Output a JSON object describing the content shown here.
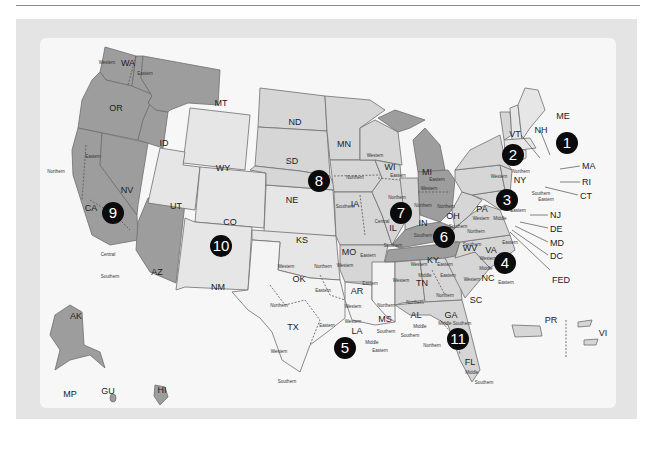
{
  "map": {
    "title": "U.S. Federal Judicial Circuits and Districts",
    "colors": {
      "frame": "#e4e4e4",
      "panel": "#f7f7f7",
      "shade_dark": "#9d9d9d",
      "shade_mid": "#b9b9b9",
      "shade_light": "#d6d6d6",
      "shade_pale": "#e6e6e6",
      "shade_white": "#f4f4f4",
      "badge": "#0b0b0b"
    },
    "states": [
      {
        "abbr": "WA",
        "districts": [
          "Western",
          "Eastern"
        ]
      },
      {
        "abbr": "OR",
        "districts": []
      },
      {
        "abbr": "ID",
        "districts": []
      },
      {
        "abbr": "MT",
        "districts": []
      },
      {
        "abbr": "CA",
        "districts": [
          "Northern",
          "Eastern",
          "Central",
          "Southern"
        ]
      },
      {
        "abbr": "NV",
        "districts": []
      },
      {
        "abbr": "AZ",
        "districts": []
      },
      {
        "abbr": "AK",
        "districts": []
      },
      {
        "abbr": "HI",
        "districts": []
      },
      {
        "abbr": "GU",
        "districts": []
      },
      {
        "abbr": "MP",
        "districts": []
      },
      {
        "abbr": "WY",
        "districts": []
      },
      {
        "abbr": "UT",
        "districts": []
      },
      {
        "abbr": "CO",
        "districts": []
      },
      {
        "abbr": "NM",
        "districts": []
      },
      {
        "abbr": "KS",
        "districts": []
      },
      {
        "abbr": "OK",
        "districts": [
          "Western",
          "Northern",
          "Eastern"
        ]
      },
      {
        "abbr": "ND",
        "districts": []
      },
      {
        "abbr": "SD",
        "districts": []
      },
      {
        "abbr": "NE",
        "districts": []
      },
      {
        "abbr": "MN",
        "districts": []
      },
      {
        "abbr": "IA",
        "districts": [
          "Northern",
          "Southern"
        ]
      },
      {
        "abbr": "MO",
        "districts": [
          "Western",
          "Eastern"
        ]
      },
      {
        "abbr": "AR",
        "districts": [
          "Western",
          "Eastern"
        ]
      },
      {
        "abbr": "TX",
        "districts": [
          "Northern",
          "Eastern",
          "Western",
          "Southern"
        ]
      },
      {
        "abbr": "LA",
        "districts": [
          "Western",
          "Middle",
          "Eastern"
        ]
      },
      {
        "abbr": "MS",
        "districts": [
          "Northern",
          "Southern"
        ]
      },
      {
        "abbr": "WI",
        "districts": [
          "Western",
          "Eastern"
        ]
      },
      {
        "abbr": "IL",
        "districts": [
          "Northern",
          "Central",
          "Southern"
        ]
      },
      {
        "abbr": "IN",
        "districts": [
          "Northern",
          "Southern"
        ]
      },
      {
        "abbr": "MI",
        "districts": [
          "Western",
          "Eastern"
        ]
      },
      {
        "abbr": "OH",
        "districts": [
          "Northern",
          "Southern"
        ]
      },
      {
        "abbr": "KY",
        "districts": [
          "Western",
          "Eastern"
        ]
      },
      {
        "abbr": "TN",
        "districts": [
          "Western",
          "Middle",
          "Eastern"
        ]
      },
      {
        "abbr": "AL",
        "districts": [
          "Northern",
          "Middle",
          "Southern"
        ]
      },
      {
        "abbr": "GA",
        "districts": [
          "Northern",
          "Middle",
          "Southern"
        ]
      },
      {
        "abbr": "FL",
        "districts": [
          "Northern",
          "Middle",
          "Southern"
        ]
      },
      {
        "abbr": "SC",
        "districts": []
      },
      {
        "abbr": "NC",
        "districts": [
          "Western",
          "Middle",
          "Eastern"
        ]
      },
      {
        "abbr": "VA",
        "districts": [
          "Western",
          "Eastern"
        ]
      },
      {
        "abbr": "WV",
        "districts": [
          "Northern",
          "Southern"
        ]
      },
      {
        "abbr": "MD",
        "districts": []
      },
      {
        "abbr": "DE",
        "districts": []
      },
      {
        "abbr": "DC",
        "districts": []
      },
      {
        "abbr": "PA",
        "districts": [
          "Western",
          "Middle",
          "Eastern"
        ]
      },
      {
        "abbr": "NJ",
        "districts": []
      },
      {
        "abbr": "NY",
        "districts": [
          "Western",
          "Northern",
          "Southern",
          "Eastern"
        ]
      },
      {
        "abbr": "CT",
        "districts": []
      },
      {
        "abbr": "RI",
        "districts": []
      },
      {
        "abbr": "MA",
        "districts": []
      },
      {
        "abbr": "VT",
        "districts": []
      },
      {
        "abbr": "NH",
        "districts": []
      },
      {
        "abbr": "ME",
        "districts": []
      },
      {
        "abbr": "PR",
        "districts": []
      },
      {
        "abbr": "VI",
        "districts": []
      },
      {
        "abbr": "FED",
        "districts": []
      }
    ],
    "circuits": [
      "1",
      "2",
      "3",
      "4",
      "5",
      "6",
      "7",
      "8",
      "9",
      "10",
      "11"
    ],
    "labels": {
      "WA": "WA",
      "OR": "OR",
      "ID": "ID",
      "MT": "MT",
      "CA": "CA",
      "NV": "NV",
      "AZ": "AZ",
      "AK": "AK",
      "HI": "HI",
      "GU": "GU",
      "MP": "MP",
      "WY": "WY",
      "UT": "UT",
      "CO": "CO",
      "NM": "NM",
      "KS": "KS",
      "OK": "OK",
      "ND": "ND",
      "SD": "SD",
      "NE": "NE",
      "MN": "MN",
      "IA": "IA",
      "MO": "MO",
      "AR": "AR",
      "TX": "TX",
      "LA": "LA",
      "MS": "MS",
      "WI": "WI",
      "IL": "IL",
      "IN": "IN",
      "MI": "MI",
      "OH": "OH",
      "KY": "KY",
      "TN": "TN",
      "AL": "AL",
      "GA": "GA",
      "FL": "FL",
      "SC": "SC",
      "NC": "NC",
      "VA": "VA",
      "WV": "WV",
      "MD": "MD",
      "DE": "DE",
      "DC": "DC",
      "PA": "PA",
      "NJ": "NJ",
      "NY": "NY",
      "CT": "CT",
      "RI": "RI",
      "MA": "MA",
      "VT": "VT",
      "NH": "NH",
      "ME": "ME",
      "PR": "PR",
      "VI": "VI",
      "FED": "FED"
    },
    "district_labels": {
      "western": "Western",
      "eastern": "Eastern",
      "northern": "Northern",
      "southern": "Southern",
      "central": "Central",
      "middle": "Middle"
    }
  }
}
